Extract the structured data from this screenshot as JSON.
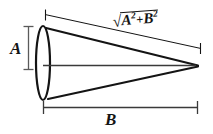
{
  "figure": {
    "type": "cone-dimension-diagram",
    "background_color": "#ffffff",
    "stroke_color": "#141414",
    "labels": {
      "height_label": "A",
      "length_label": "B",
      "slant_label": {
        "radical_symbol": "√",
        "term_1_base": "A",
        "term_1_exponent": "2",
        "operator": "+",
        "term_2_base": "B",
        "term_2_exponent": "2",
        "plain_text": "√(A²+B²)"
      }
    },
    "geometry": {
      "ellipse_center_x": 43,
      "ellipse_center_y": 63,
      "ellipse_radius_x": 7,
      "ellipse_radius_y": 37,
      "apex_x": 198,
      "apex_y": 66,
      "axis_line_start_x": 43,
      "axis_line_y": 65,
      "top_edge_start_x": 46,
      "top_edge_start_y": 28,
      "bottom_edge_start_x": 48,
      "bottom_edge_start_y": 99
    },
    "dimension_lines": {
      "vertical_a": {
        "x": 28,
        "y_top": 26,
        "y_bottom": 70,
        "tick_half_width": 5
      },
      "horizontal_b": {
        "y": 107,
        "x_left": 43,
        "x_right": 198,
        "tick_half_height": 6
      },
      "slant": {
        "x1": 45,
        "y1": 14,
        "x2": 201,
        "y2": 48,
        "tick_length": 11
      }
    }
  }
}
